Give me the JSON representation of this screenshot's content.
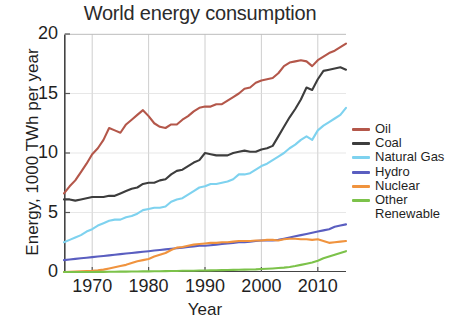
{
  "chart_data": {
    "type": "line",
    "title": "World energy consumption",
    "xlabel": "Year",
    "ylabel": "Energy, 1000 TWh per year",
    "xlim": [
      1965,
      2015
    ],
    "ylim": [
      0,
      20
    ],
    "xticks": [
      1970,
      1980,
      1990,
      2000,
      2010
    ],
    "yticks": [
      0,
      5,
      10,
      15,
      20
    ],
    "grid": true,
    "legend_position": "right",
    "x": [
      1965,
      1966,
      1967,
      1968,
      1969,
      1970,
      1971,
      1972,
      1973,
      1974,
      1975,
      1976,
      1977,
      1978,
      1979,
      1980,
      1981,
      1982,
      1983,
      1984,
      1985,
      1986,
      1987,
      1988,
      1989,
      1990,
      1991,
      1992,
      1993,
      1994,
      1995,
      1996,
      1997,
      1998,
      1999,
      2000,
      2001,
      2002,
      2003,
      2004,
      2005,
      2006,
      2007,
      2008,
      2009,
      2010,
      2011,
      2012,
      2013,
      2014,
      2015
    ],
    "series": [
      {
        "name": "Oil",
        "color": "#b4574a",
        "values": [
          6.6,
          7.2,
          7.7,
          8.4,
          9.1,
          9.9,
          10.4,
          11.1,
          12.1,
          11.9,
          11.7,
          12.4,
          12.8,
          13.2,
          13.6,
          13.1,
          12.5,
          12.2,
          12.1,
          12.4,
          12.4,
          12.8,
          13.1,
          13.5,
          13.8,
          13.9,
          13.9,
          14.1,
          14.1,
          14.4,
          14.7,
          15.0,
          15.4,
          15.5,
          15.9,
          16.1,
          16.2,
          16.3,
          16.7,
          17.3,
          17.6,
          17.7,
          17.8,
          17.7,
          17.3,
          17.8,
          18.1,
          18.4,
          18.6,
          18.9,
          19.2
        ]
      },
      {
        "name": "Coal",
        "color": "#3d3d3d",
        "values": [
          6.1,
          6.1,
          6.0,
          6.1,
          6.2,
          6.3,
          6.3,
          6.3,
          6.4,
          6.4,
          6.6,
          6.8,
          7.0,
          7.1,
          7.4,
          7.5,
          7.5,
          7.7,
          7.8,
          8.2,
          8.5,
          8.6,
          8.9,
          9.2,
          9.4,
          10.0,
          9.9,
          9.8,
          9.8,
          9.8,
          10.0,
          10.1,
          10.2,
          10.1,
          10.1,
          10.3,
          10.4,
          10.6,
          11.4,
          12.2,
          13.0,
          13.7,
          14.5,
          15.5,
          15.3,
          16.2,
          16.9,
          17.0,
          17.1,
          17.2,
          17.0
        ]
      },
      {
        "name": "Natural Gas",
        "color": "#7ed2ef",
        "values": [
          2.5,
          2.7,
          2.9,
          3.1,
          3.4,
          3.6,
          3.9,
          4.1,
          4.3,
          4.4,
          4.4,
          4.6,
          4.7,
          4.9,
          5.2,
          5.3,
          5.4,
          5.4,
          5.5,
          5.9,
          6.1,
          6.2,
          6.5,
          6.8,
          7.1,
          7.2,
          7.4,
          7.4,
          7.5,
          7.6,
          7.8,
          8.2,
          8.2,
          8.3,
          8.6,
          8.9,
          9.1,
          9.4,
          9.7,
          10.0,
          10.4,
          10.7,
          11.1,
          11.4,
          11.1,
          11.9,
          12.3,
          12.6,
          12.9,
          13.2,
          13.8
        ]
      },
      {
        "name": "Hydro",
        "color": "#5a5ec0",
        "values": [
          1.0,
          1.05,
          1.1,
          1.15,
          1.2,
          1.25,
          1.3,
          1.35,
          1.4,
          1.45,
          1.5,
          1.55,
          1.6,
          1.65,
          1.7,
          1.75,
          1.8,
          1.85,
          1.9,
          1.95,
          2.0,
          2.05,
          2.1,
          2.15,
          2.2,
          2.2,
          2.25,
          2.3,
          2.35,
          2.4,
          2.45,
          2.5,
          2.5,
          2.55,
          2.6,
          2.65,
          2.65,
          2.65,
          2.7,
          2.8,
          2.9,
          3.0,
          3.1,
          3.2,
          3.3,
          3.4,
          3.5,
          3.6,
          3.8,
          3.9,
          4.0
        ]
      },
      {
        "name": "Nuclear",
        "color": "#f0933e",
        "values": [
          0.0,
          0.02,
          0.04,
          0.06,
          0.08,
          0.1,
          0.14,
          0.2,
          0.3,
          0.4,
          0.5,
          0.6,
          0.75,
          0.9,
          1.0,
          1.1,
          1.3,
          1.45,
          1.6,
          1.85,
          2.05,
          2.1,
          2.2,
          2.3,
          2.35,
          2.4,
          2.45,
          2.45,
          2.5,
          2.5,
          2.55,
          2.6,
          2.6,
          2.6,
          2.65,
          2.65,
          2.7,
          2.7,
          2.65,
          2.75,
          2.8,
          2.8,
          2.75,
          2.75,
          2.7,
          2.75,
          2.6,
          2.45,
          2.5,
          2.55,
          2.6
        ]
      },
      {
        "name": "Other Renewable",
        "color": "#7cc24a",
        "values": [
          0.0,
          0.0,
          0.0,
          0.0,
          0.0,
          0.0,
          0.01,
          0.01,
          0.02,
          0.02,
          0.03,
          0.03,
          0.04,
          0.04,
          0.05,
          0.05,
          0.06,
          0.06,
          0.07,
          0.08,
          0.09,
          0.1,
          0.1,
          0.11,
          0.12,
          0.13,
          0.14,
          0.15,
          0.16,
          0.17,
          0.18,
          0.19,
          0.2,
          0.21,
          0.22,
          0.25,
          0.27,
          0.3,
          0.33,
          0.37,
          0.42,
          0.5,
          0.6,
          0.7,
          0.8,
          0.95,
          1.15,
          1.3,
          1.45,
          1.6,
          1.75
        ]
      }
    ]
  },
  "legend": {
    "items": [
      {
        "label": "Oil"
      },
      {
        "label": "Coal"
      },
      {
        "label": "Natural Gas"
      },
      {
        "label": "Hydro"
      },
      {
        "label": "Nuclear"
      },
      {
        "label": "Other"
      }
    ],
    "continuation": "Renewable"
  }
}
